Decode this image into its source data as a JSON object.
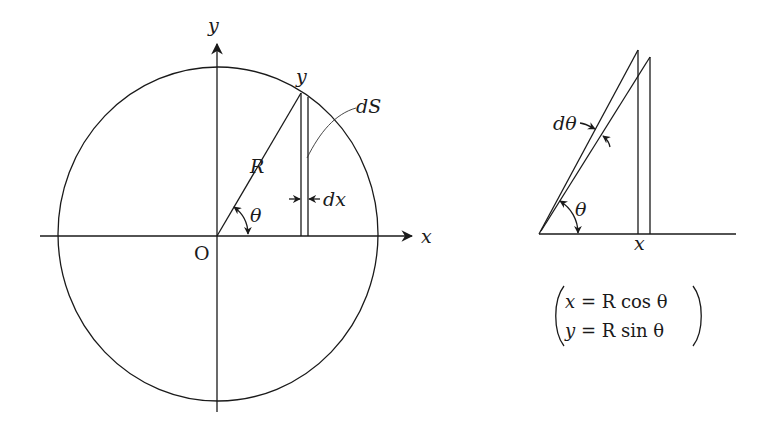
{
  "left_diagram": {
    "labels": {
      "y_axis": "y",
      "x_axis": "x",
      "origin": "O",
      "radius": "R",
      "point_y": "y",
      "strip_area": "dS",
      "strip_width": "dx",
      "angle": "θ"
    }
  },
  "right_diagram": {
    "labels": {
      "d_angle": "dθ",
      "angle": "θ",
      "x_mark": "x"
    },
    "equations": {
      "line1_var": "x",
      "line1_rest": " = R cos θ",
      "line2_var": "y",
      "line2_rest": " = R sin θ",
      "line1": "x = R cos θ",
      "line2": "y = R sin θ"
    }
  }
}
